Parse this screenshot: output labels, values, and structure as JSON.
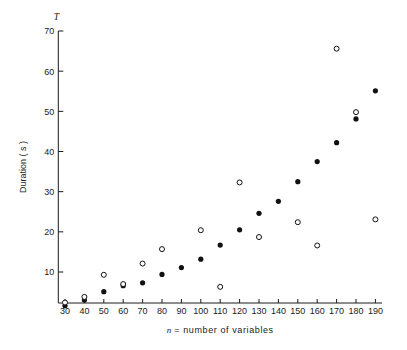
{
  "chart_data": {
    "type": "scatter",
    "title": "",
    "xlabel": "n = number of variables",
    "ylabel": "Duration ( s )",
    "corner_symbol": "T",
    "xlim": [
      25,
      195
    ],
    "ylim": [
      0,
      70
    ],
    "xticks": [
      30,
      40,
      50,
      60,
      70,
      80,
      90,
      100,
      110,
      120,
      130,
      140,
      150,
      160,
      170,
      180,
      190
    ],
    "yticks": [
      10,
      20,
      30,
      40,
      50,
      60,
      70
    ],
    "xtick_labels": [
      "30",
      "40",
      "50",
      "60",
      "70",
      "80",
      "90",
      "100",
      "110",
      "120",
      "130",
      "140",
      "150",
      "160",
      "170",
      "180",
      "190"
    ],
    "ytick_labels": [
      "10",
      "20",
      "30",
      "40",
      "50",
      "60",
      "70"
    ],
    "grid": false,
    "legend": "none",
    "marker_colors": {
      "filled": "#111111",
      "open_stroke": "#111111",
      "open_fill": "#ffffff"
    },
    "series": [
      {
        "name": "filled-circles",
        "marker": "filled-circle",
        "x": [
          30,
          40,
          50,
          60,
          70,
          80,
          90,
          100,
          110,
          120,
          130,
          140,
          150,
          160,
          170,
          180,
          190
        ],
        "y": [
          1.6,
          3.0,
          5.1,
          6.6,
          7.3,
          9.4,
          11.1,
          13.2,
          16.7,
          20.5,
          24.6,
          27.6,
          32.5,
          37.5,
          42.2,
          48.1,
          55.1
        ]
      },
      {
        "name": "open-circles",
        "marker": "open-circle",
        "x": [
          30,
          40,
          50,
          60,
          70,
          80,
          100,
          110,
          120,
          130,
          150,
          160,
          170,
          180,
          190
        ],
        "y": [
          2.4,
          3.8,
          9.3,
          7.0,
          12.1,
          15.7,
          20.4,
          6.3,
          32.3,
          18.7,
          22.4,
          16.6,
          65.6,
          49.8,
          23.1
        ]
      }
    ]
  }
}
